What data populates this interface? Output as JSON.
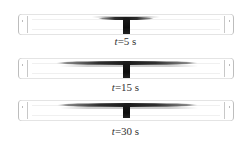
{
  "figure": {
    "colors": {
      "background": "#ffffff",
      "plume": "#111111",
      "tube_outline": "#bdbdbd",
      "label_text": "#333333"
    },
    "panels": [
      {
        "time_var": "t",
        "time_value": "=5 s",
        "label": "t=5 s",
        "plume_extent": "narrow"
      },
      {
        "time_var": "t",
        "time_value": "=15 s",
        "label": "t=15 s",
        "plume_extent": "wide"
      },
      {
        "time_var": "t",
        "time_value": "=30 s",
        "label": "t=30 s",
        "plume_extent": "wide"
      }
    ]
  }
}
